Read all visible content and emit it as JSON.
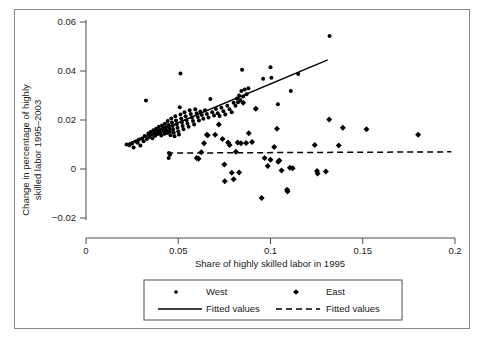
{
  "chart_data": {
    "type": "scatter",
    "title": "",
    "xlabel": "Share of highly skilled labor in 1995",
    "ylabel": "Change in percentage of highly\nskilled labor 1995–2003",
    "ylabel_line1": "Change in percentage of highly",
    "ylabel_line2": "skilled labor 1995–2003",
    "xlim": [
      0,
      0.2
    ],
    "ylim": [
      -0.02,
      0.06
    ],
    "xticks": [
      0,
      0.05,
      0.1,
      0.15,
      0.2
    ],
    "xtick_labels": [
      "0",
      "0.05",
      "0.1",
      "0.15",
      "0.2"
    ],
    "yticks": [
      -0.02,
      0,
      0.02,
      0.04,
      0.06
    ],
    "ytick_labels": [
      "-0.02",
      "0",
      "0.02",
      "0.04",
      "0.06"
    ],
    "grid": false,
    "legend_position": "below-axis-centered",
    "series": [
      {
        "name": "West",
        "marker": "small-dot",
        "color": "#000000",
        "points": [
          [
            0.022,
            0.01
          ],
          [
            0.0235,
            0.0097
          ],
          [
            0.025,
            0.0104
          ],
          [
            0.0258,
            0.0088
          ],
          [
            0.027,
            0.0112
          ],
          [
            0.028,
            0.0107
          ],
          [
            0.0288,
            0.012
          ],
          [
            0.0295,
            0.0096
          ],
          [
            0.0305,
            0.0125
          ],
          [
            0.0312,
            0.0113
          ],
          [
            0.0318,
            0.0135
          ],
          [
            0.0325,
            0.028
          ],
          [
            0.033,
            0.0122
          ],
          [
            0.0338,
            0.0145
          ],
          [
            0.0342,
            0.0131
          ],
          [
            0.035,
            0.0151
          ],
          [
            0.0355,
            0.014
          ],
          [
            0.036,
            0.0126
          ],
          [
            0.0365,
            0.0158
          ],
          [
            0.037,
            0.0147
          ],
          [
            0.0375,
            0.0136
          ],
          [
            0.038,
            0.0164
          ],
          [
            0.0385,
            0.0152
          ],
          [
            0.039,
            0.0143
          ],
          [
            0.0395,
            0.0172
          ],
          [
            0.04,
            0.016
          ],
          [
            0.0402,
            0.0148
          ],
          [
            0.0408,
            0.0137
          ],
          [
            0.0412,
            0.0178
          ],
          [
            0.0418,
            0.0166
          ],
          [
            0.042,
            0.0155
          ],
          [
            0.0425,
            0.0144
          ],
          [
            0.0428,
            0.0185
          ],
          [
            0.0432,
            0.017
          ],
          [
            0.0436,
            0.0158
          ],
          [
            0.044,
            0.0147
          ],
          [
            0.0443,
            0.0196
          ],
          [
            0.0448,
            0.018
          ],
          [
            0.0452,
            0.0165
          ],
          [
            0.0455,
            0.0152
          ],
          [
            0.0458,
            0.0138
          ],
          [
            0.0462,
            0.0206
          ],
          [
            0.0466,
            0.019
          ],
          [
            0.047,
            0.0176
          ],
          [
            0.0472,
            0.0161
          ],
          [
            0.0476,
            0.0148
          ],
          [
            0.048,
            0.0134
          ],
          [
            0.0484,
            0.0215
          ],
          [
            0.0488,
            0.0198
          ],
          [
            0.0492,
            0.0183
          ],
          [
            0.0496,
            0.0168
          ],
          [
            0.05,
            0.0154
          ],
          [
            0.0504,
            0.0141
          ],
          [
            0.0508,
            0.0252
          ],
          [
            0.0512,
            0.0222
          ],
          [
            0.0512,
            0.039
          ],
          [
            0.0516,
            0.0205
          ],
          [
            0.052,
            0.019
          ],
          [
            0.0524,
            0.0176
          ],
          [
            0.0528,
            0.0162
          ],
          [
            0.0534,
            0.0232
          ],
          [
            0.054,
            0.0215
          ],
          [
            0.0545,
            0.0199
          ],
          [
            0.055,
            0.0186
          ],
          [
            0.0556,
            0.0172
          ],
          [
            0.0562,
            0.024
          ],
          [
            0.0568,
            0.0225
          ],
          [
            0.0574,
            0.021
          ],
          [
            0.058,
            0.0196
          ],
          [
            0.0586,
            0.0182
          ],
          [
            0.0592,
            0.0244
          ],
          [
            0.06,
            0.0228
          ],
          [
            0.0606,
            0.0212
          ],
          [
            0.0612,
            0.0198
          ],
          [
            0.062,
            0.0235
          ],
          [
            0.0628,
            0.022
          ],
          [
            0.0636,
            0.0205
          ],
          [
            0.0645,
            0.024
          ],
          [
            0.0655,
            0.0224
          ],
          [
            0.0664,
            0.021
          ],
          [
            0.0674,
            0.0286
          ],
          [
            0.0684,
            0.0232
          ],
          [
            0.0694,
            0.0218
          ],
          [
            0.0704,
            0.0245
          ],
          [
            0.0714,
            0.0228
          ],
          [
            0.0724,
            0.0216
          ],
          [
            0.0734,
            0.025
          ],
          [
            0.0745,
            0.0236
          ],
          [
            0.0755,
            0.0222
          ],
          [
            0.0766,
            0.0258
          ],
          [
            0.0778,
            0.0244
          ],
          [
            0.079,
            0.0232
          ],
          [
            0.08,
            0.027
          ],
          [
            0.081,
            0.0258
          ],
          [
            0.0818,
            0.0288
          ],
          [
            0.0824,
            0.0272
          ],
          [
            0.083,
            0.03
          ],
          [
            0.0836,
            0.0282
          ],
          [
            0.0842,
            0.0318
          ],
          [
            0.0846,
            0.0405
          ],
          [
            0.0852,
            0.0296
          ],
          [
            0.086,
            0.0325
          ],
          [
            0.087,
            0.0305
          ],
          [
            0.088,
            0.033
          ],
          [
            0.045,
            0.0065
          ],
          [
            0.0448,
            0.0045
          ],
          [
            0.0455,
            0.0058
          ],
          [
            0.096,
            0.0368
          ],
          [
            0.1,
            0.0415
          ],
          [
            0.1005,
            0.0372
          ],
          [
            0.115,
            0.0388
          ],
          [
            0.132,
            0.0543
          ],
          [
            0.092,
            0.0246
          ],
          [
            0.104,
            0.0264
          ],
          [
            0.111,
            0.0318
          ]
        ]
      },
      {
        "name": "East",
        "marker": "diamond",
        "color": "#000000",
        "points": [
          [
            0.06,
            0.0045
          ],
          [
            0.061,
            0.0042
          ],
          [
            0.0625,
            0.0068
          ],
          [
            0.064,
            0.0105
          ],
          [
            0.0655,
            0.014
          ],
          [
            0.07,
            0.014
          ],
          [
            0.072,
            0.0182
          ],
          [
            0.075,
            0.0018
          ],
          [
            0.0752,
            -0.005
          ],
          [
            0.077,
            0.0108
          ],
          [
            0.0778,
            0.0098
          ],
          [
            0.079,
            -0.0015
          ],
          [
            0.08,
            -0.0042
          ],
          [
            0.0812,
            0.007
          ],
          [
            0.0822,
            0.0108
          ],
          [
            0.083,
            -0.0014
          ],
          [
            0.084,
            0.0105
          ],
          [
            0.0852,
            0.027
          ],
          [
            0.0868,
            0.0106
          ],
          [
            0.0882,
            0.0146
          ],
          [
            0.09,
            0.011
          ],
          [
            0.092,
            0.0246
          ],
          [
            0.0952,
            -0.0118
          ],
          [
            0.0968,
            0.0045
          ],
          [
            0.0985,
            0.0012
          ],
          [
            0.1,
            0.0038
          ],
          [
            0.102,
            0.009
          ],
          [
            0.1035,
            0.0164
          ],
          [
            0.1042,
            0.003
          ],
          [
            0.1048,
            0.0035
          ],
          [
            0.106,
            -0.0006
          ],
          [
            0.109,
            -0.0085
          ],
          [
            0.1092,
            -0.0092
          ],
          [
            0.1105,
            0.0005
          ],
          [
            0.112,
            0.0003
          ],
          [
            0.124,
            0.0098
          ],
          [
            0.1252,
            -0.0008
          ],
          [
            0.1255,
            -0.0018
          ],
          [
            0.13,
            -0.001
          ],
          [
            0.1318,
            0.0202
          ],
          [
            0.137,
            0.0096
          ],
          [
            0.1392,
            0.0168
          ],
          [
            0.152,
            0.0162
          ],
          [
            0.18,
            0.014
          ],
          [
            0.066,
            0.0138
          ],
          [
            0.074,
            0.0122
          ]
        ]
      }
    ],
    "fits": [
      {
        "name": "Fitted values",
        "style": "solid",
        "for_series": "West",
        "x_start": 0.0215,
        "y_start": 0.0099,
        "x_end": 0.131,
        "y_end": 0.0445
      },
      {
        "name": "Fitted values",
        "style": "dashed",
        "for_series": "East",
        "x_start": 0.044,
        "y_start": 0.0065,
        "x_end": 0.198,
        "y_end": 0.007
      }
    ],
    "legend": [
      {
        "label": "West",
        "marker": "small-dot"
      },
      {
        "label": "East",
        "marker": "diamond"
      },
      {
        "label": "Fitted values",
        "marker": "solid-line"
      },
      {
        "label": "Fitted values",
        "marker": "dashed-line"
      }
    ]
  }
}
